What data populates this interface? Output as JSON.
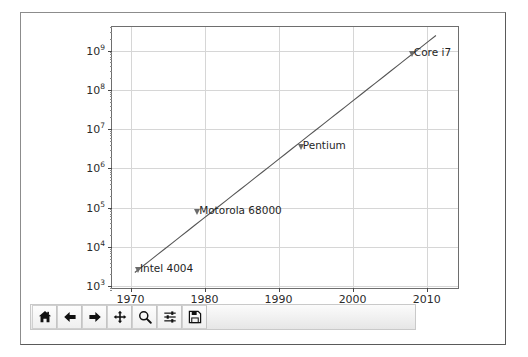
{
  "window": {
    "name": "matplotlib-figure-window"
  },
  "chart_data": {
    "type": "line",
    "title": "",
    "xlabel": "",
    "ylabel": "",
    "yscale": "log",
    "xlim": [
      1967.5,
      2014.5
    ],
    "ylim": [
      800,
      4000000000
    ],
    "grid": true,
    "legend": null,
    "x": [
      1971,
      1979,
      1993,
      2008
    ],
    "values": [
      2300,
      68000,
      3100000,
      731000000
    ],
    "series": [
      {
        "name": "Transistor count",
        "x": [
          1971,
          1979,
          1993,
          2008
        ],
        "values": [
          2300,
          68000,
          3100000,
          731000000
        ]
      }
    ],
    "xticks": [
      "1970",
      "1980",
      "1990",
      "2000",
      "2010"
    ],
    "xtick_values": [
      1970,
      1980,
      1990,
      2000,
      2010
    ],
    "ytick_labels": [
      "10",
      "10",
      "10",
      "10",
      "10",
      "10",
      "10"
    ],
    "ytick_exponents": [
      "3",
      "4",
      "5",
      "6",
      "7",
      "8",
      "9"
    ],
    "ytick_values": [
      1000,
      10000,
      100000,
      1000000,
      10000000,
      100000000,
      1000000000
    ],
    "annotations": [
      {
        "label": "Intel 4004",
        "x": 1971,
        "y": 2300
      },
      {
        "label": "Motorola 68000",
        "x": 1979,
        "y": 68000
      },
      {
        "label": "Pentium",
        "x": 1993,
        "y": 3100000
      },
      {
        "label": "Core i7",
        "x": 2008,
        "y": 731000000
      }
    ],
    "line_color": "#555555",
    "grid_color": "#d6d6d6",
    "axes_color": "#6e6e6e"
  },
  "toolbar": {
    "name": "navigation-toolbar",
    "buttons": [
      {
        "name": "home-icon",
        "tooltip": "Reset original view"
      },
      {
        "name": "arrow-left-icon",
        "tooltip": "Back to previous view"
      },
      {
        "name": "arrow-right-icon",
        "tooltip": "Forward to next view"
      },
      {
        "name": "move-icon",
        "tooltip": "Pan axes with left mouse, zoom with right"
      },
      {
        "name": "magnifier-icon",
        "tooltip": "Zoom to rectangle"
      },
      {
        "name": "sliders-icon",
        "tooltip": "Configure subplots"
      },
      {
        "name": "save-icon",
        "tooltip": "Save the figure"
      }
    ]
  }
}
